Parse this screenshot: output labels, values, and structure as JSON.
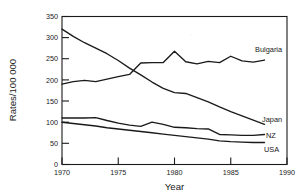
{
  "chart_data": {
    "type": "line",
    "title": "",
    "xlabel": "Year",
    "ylabel": "Rates/100 000",
    "xlim": [
      1970,
      1990
    ],
    "ylim": [
      0,
      350
    ],
    "xticks": [
      1970,
      1975,
      1980,
      1985,
      1990
    ],
    "yticks": [
      0,
      50,
      100,
      150,
      200,
      250,
      300,
      350
    ],
    "grid": false,
    "legend_position": "inline-right-labels",
    "series": [
      {
        "name": "Bulgaria",
        "label": "Bulgaria",
        "x": [
          1970,
          1971,
          1972,
          1973,
          1974,
          1975,
          1976,
          1977,
          1978,
          1979,
          1980,
          1981,
          1982,
          1983,
          1984,
          1985,
          1986,
          1987,
          1988
        ],
        "values": [
          190,
          196,
          199,
          196,
          202,
          208,
          213,
          240,
          241,
          241,
          268,
          243,
          238,
          244,
          241,
          256,
          245,
          242,
          247
        ]
      },
      {
        "name": "Japan",
        "label": "Japan",
        "x": [
          1970,
          1971,
          1972,
          1973,
          1974,
          1975,
          1976,
          1977,
          1978,
          1979,
          1980,
          1981,
          1982,
          1983,
          1984,
          1985,
          1986,
          1987,
          1988
        ],
        "values": [
          320,
          303,
          288,
          275,
          262,
          246,
          228,
          212,
          195,
          180,
          170,
          168,
          158,
          148,
          136,
          125,
          115,
          105,
          95
        ]
      },
      {
        "name": "NZ",
        "label": "NZ",
        "x": [
          1970,
          1971,
          1972,
          1973,
          1974,
          1975,
          1976,
          1977,
          1978,
          1979,
          1980,
          1981,
          1982,
          1983,
          1984,
          1985,
          1986,
          1987,
          1988
        ],
        "values": [
          110,
          110,
          110,
          111,
          104,
          98,
          93,
          90,
          100,
          95,
          88,
          87,
          85,
          84,
          71,
          70,
          69,
          69,
          71
        ]
      },
      {
        "name": "USA",
        "label": "USA",
        "x": [
          1970,
          1971,
          1972,
          1973,
          1974,
          1975,
          1976,
          1977,
          1978,
          1979,
          1980,
          1981,
          1982,
          1983,
          1984,
          1985,
          1986,
          1987,
          1988
        ],
        "values": [
          100,
          97,
          94,
          91,
          87,
          84,
          81,
          78,
          75,
          72,
          69,
          66,
          63,
          60,
          56,
          54,
          53,
          52,
          52
        ]
      }
    ]
  },
  "axis": {
    "y_title": "Rates/100 000",
    "x_title": "Year",
    "y_tick_labels": [
      "0",
      "50",
      "100",
      "150",
      "200",
      "250",
      "300",
      "350"
    ],
    "x_tick_labels": [
      "1970",
      "1975",
      "1980",
      "1985",
      "1990"
    ]
  },
  "labels": {
    "bulgaria": "Bulgaria",
    "japan": "Japan",
    "nz": "NZ",
    "usa": "USA"
  },
  "colors": {
    "ink": "#1a1a1a",
    "background": "#ffffff"
  }
}
